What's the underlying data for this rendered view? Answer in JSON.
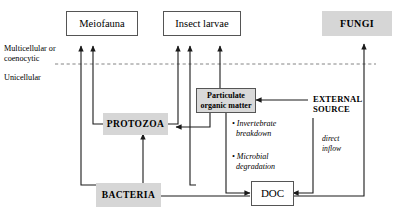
{
  "diagram": {
    "background": "#ffffff",
    "grey_fill": "#d6d6d6",
    "line_color": "#1a1a1a",
    "divider": {
      "style": "dashed",
      "above_label": "Multicellular or coenocytic",
      "below_label": "Unicellular"
    },
    "nodes": {
      "meiofauna": {
        "label": "Meiofauna",
        "fill": "white",
        "bordered": true
      },
      "insect_larvae": {
        "label": "Insect larvae",
        "fill": "white",
        "bordered": true
      },
      "fungi": {
        "label": "FUNGI",
        "fill": "grey",
        "bordered": false
      },
      "pom": {
        "label_line1": "Particulate",
        "label_line2": "organic matter",
        "fill": "grey",
        "bordered": true
      },
      "protozoa": {
        "label": "PROTOZOA",
        "fill": "grey",
        "bordered": false
      },
      "bacteria": {
        "label": "BACTERIA",
        "fill": "grey",
        "bordered": false
      },
      "doc": {
        "label": "DOC",
        "fill": "white",
        "bordered": true
      },
      "external_source": {
        "label_line1": "EXTERNAL",
        "label_line2": "SOURCE",
        "fill": "none",
        "bordered": false
      }
    },
    "annotations": {
      "invertebrate": {
        "line1": "• Invertebrate",
        "line2": "breakdown"
      },
      "microbial": {
        "line1": "• Microbial",
        "line2": "degradation"
      },
      "direct_inflow": {
        "line1": "direct",
        "line2": "inflow"
      }
    },
    "sidebar_labels": {
      "multicellular_line1": "Multicellular or",
      "multicellular_line2": "coenocytic",
      "unicellular": "Unicellular"
    },
    "edges": [
      {
        "from": "protozoa",
        "to": "meiofauna",
        "arrow": true
      },
      {
        "from": "bacteria",
        "to": "meiofauna",
        "arrow": true
      },
      {
        "from": "protozoa",
        "to": "insect_larvae",
        "arrow": true
      },
      {
        "from": "bacteria",
        "to": "insect_larvae",
        "arrow": true
      },
      {
        "from": "pom",
        "to": "insect_larvae",
        "arrow": true
      },
      {
        "from": "bacteria",
        "to": "protozoa",
        "arrow": true
      },
      {
        "from": "pom",
        "to": "protozoa",
        "arrow": true
      },
      {
        "from": "external_source",
        "to": "pom",
        "arrow": true
      },
      {
        "from": "pom",
        "to": "doc",
        "arrow": true
      },
      {
        "from": "external_source",
        "to": "doc",
        "arrow": true
      },
      {
        "from": "doc",
        "to": "bacteria",
        "arrow": true
      },
      {
        "from": "doc",
        "to": "fungi",
        "arrow": true
      }
    ]
  }
}
